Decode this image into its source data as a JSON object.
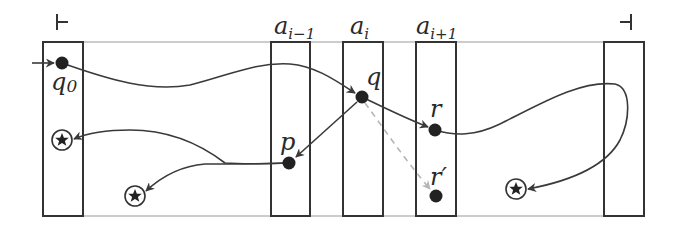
{
  "diagram": {
    "type": "two-way automaton run over tape",
    "end_markers": {
      "left": {
        "symbol": "⊢",
        "name": "left-endmarker"
      },
      "right": {
        "symbol": "⊣",
        "name": "right-endmarker"
      }
    },
    "cells": [
      {
        "id": "cell-left-end",
        "label": ""
      },
      {
        "id": "cell-a-i-minus-1",
        "label_base": "a",
        "label_sub": "i−1"
      },
      {
        "id": "cell-a-i",
        "label_base": "a",
        "label_sub": "i"
      },
      {
        "id": "cell-a-i-plus-1",
        "label_base": "a",
        "label_sub": "i+1"
      },
      {
        "id": "cell-right-end",
        "label": ""
      }
    ],
    "states": [
      {
        "id": "q0",
        "label_base": "q",
        "label_sub": "0",
        "initial": true
      },
      {
        "id": "q",
        "label_base": "q",
        "label_sub": ""
      },
      {
        "id": "p",
        "label_base": "p",
        "label_sub": ""
      },
      {
        "id": "r",
        "label_base": "r",
        "label_sub": ""
      },
      {
        "id": "r-prime",
        "label_base": "r′",
        "label_sub": ""
      }
    ],
    "accepting_markers": [
      {
        "id": "star-left-cell",
        "icon": "circled-star-icon"
      },
      {
        "id": "star-between-cells",
        "icon": "circled-star-icon"
      },
      {
        "id": "star-right-region",
        "icon": "circled-star-icon"
      }
    ],
    "edges": [
      {
        "from": "start",
        "to": "q0",
        "style": "solid"
      },
      {
        "from": "q0",
        "to": "q",
        "style": "solid"
      },
      {
        "from": "q",
        "to": "r",
        "style": "solid"
      },
      {
        "from": "q",
        "to": "p",
        "style": "solid"
      },
      {
        "from": "q",
        "to": "r-prime",
        "style": "dashed"
      },
      {
        "from": "p",
        "to": "star-left-cell",
        "style": "solid"
      },
      {
        "from": "p",
        "to": "star-between-cells",
        "style": "solid"
      },
      {
        "from": "r",
        "to": "star-right-region",
        "style": "solid"
      }
    ]
  }
}
